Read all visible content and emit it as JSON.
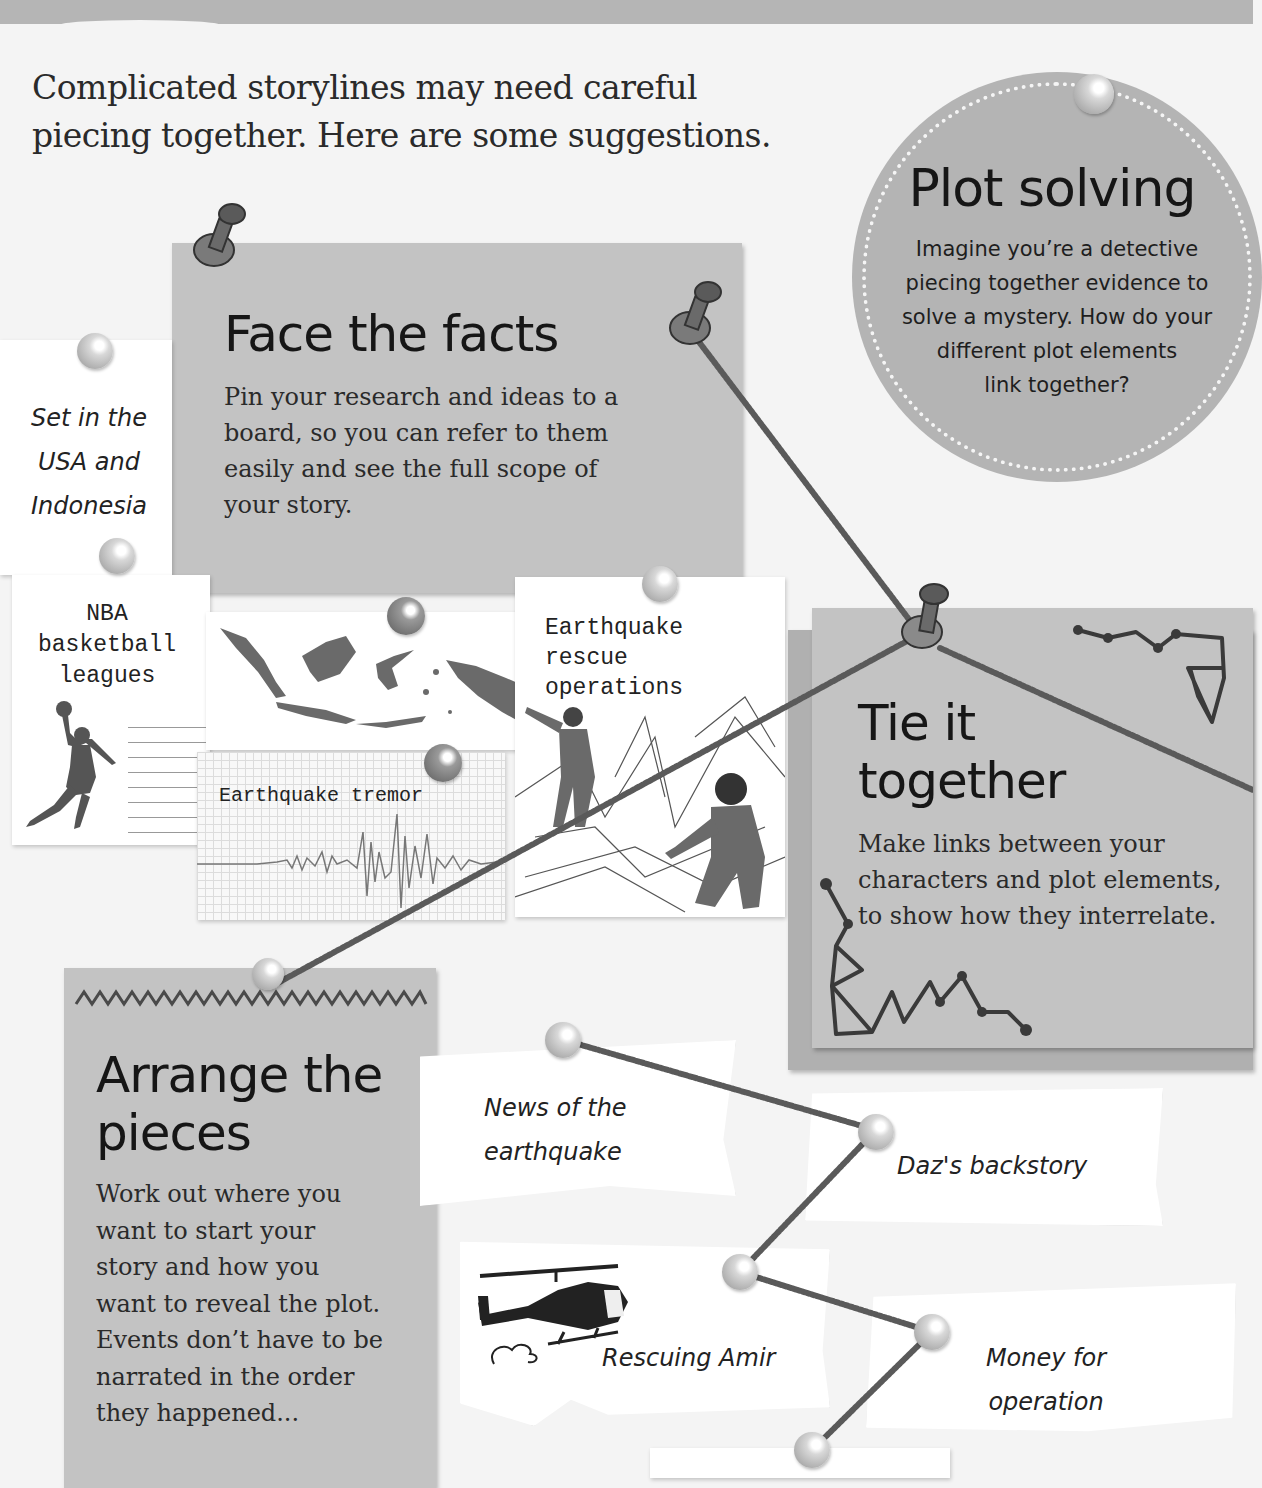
{
  "header": {
    "band_color": "#b5b5b5"
  },
  "intro": {
    "line1": "Complicated storylines may need careful",
    "line2": "piecing together. Here are some suggestions."
  },
  "plot_solving": {
    "title": "Plot solving",
    "body_lines": [
      "Imagine you’re a detective",
      "piecing together evidence to",
      "solve a mystery. How do your",
      "different plot elements",
      "link together?"
    ]
  },
  "face_the_facts": {
    "title": "Face the facts",
    "body_lines": [
      "Pin your research and ideas to a",
      "board, so you can refer to them",
      "easily and see the full scope of",
      "your story."
    ]
  },
  "tie_it_together": {
    "title_line1": "Tie it",
    "title_line2": "together",
    "body_lines": [
      "Make links between your",
      "characters and plot elements,",
      "to show how they interrelate."
    ]
  },
  "arrange_the_pieces": {
    "title_line1": "Arrange the",
    "title_line2": "pieces",
    "body_lines": [
      "Work out where you",
      "want to start your",
      "story and how you",
      "want to reveal the plot.",
      "Events don’t have to be",
      "narrated in the order",
      "they happened..."
    ]
  },
  "research_notes": {
    "setting": {
      "lines": [
        "Set in the",
        "USA and",
        "Indonesia"
      ]
    },
    "nba": {
      "lines": [
        "NBA",
        "basketball",
        "leagues"
      ],
      "icon": "basketball-player-icon"
    },
    "map": {
      "icon": "indonesia-map-icon"
    },
    "tremor": {
      "label": "Earthquake tremor",
      "icon": "seismograph-icon"
    },
    "rescue": {
      "lines": [
        "Earthquake",
        "rescue",
        "operations"
      ],
      "icon": "rescue-illustration-icon"
    }
  },
  "plot_notes": {
    "news": {
      "lines": [
        "News of the",
        "earthquake"
      ]
    },
    "backstory": {
      "label": "Daz's backstory"
    },
    "rescuing": {
      "label": "Rescuing Amir",
      "icon": "helicopter-icon"
    },
    "money": {
      "lines": [
        "Money for",
        "operation"
      ]
    }
  },
  "colors": {
    "background": "#f4f4f4",
    "card_gray": "#c3c3c3",
    "circle_gray": "#b4b4b4",
    "string": "#5a5a5a",
    "text": "#1a1a1a"
  }
}
